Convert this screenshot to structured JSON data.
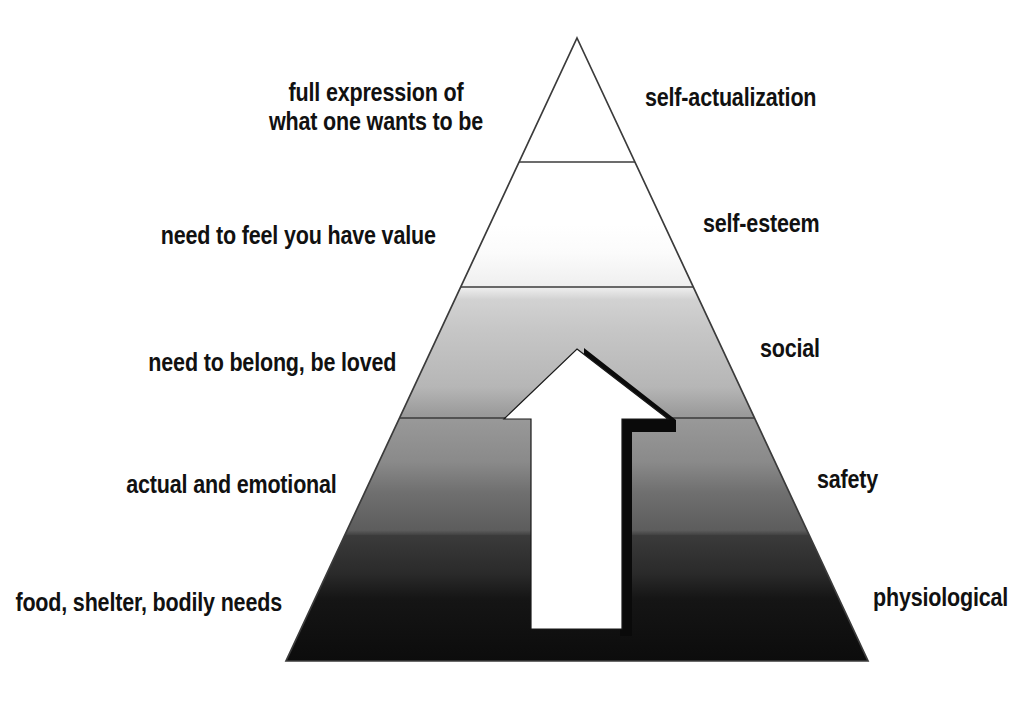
{
  "diagram": {
    "type": "maslow-hierarchy-of-needs-pyramid",
    "background_color": "#ffffff",
    "outline_color": "#333333",
    "arrow": {
      "name": "upward-progress-arrow",
      "fill_color": "#ffffff",
      "shadow_color": "#000000"
    },
    "gradient": {
      "top_color": "#ffffff",
      "bottom_color": "#0d0d0d"
    },
    "tiers": [
      {
        "id": "self-actualization",
        "name": "self-actualization",
        "description": "full expression of\nwhat one wants to be",
        "description_line_1": "full expression of",
        "description_line_2": "what one wants to be",
        "band_fill": "#ffffff"
      },
      {
        "id": "self-esteem",
        "name": "self-esteem",
        "description": "need to feel you have value",
        "band_fill": "#f2f2f2"
      },
      {
        "id": "social",
        "name": "social",
        "description": "need to belong, be loved",
        "band_fill": "#bdbdbd"
      },
      {
        "id": "safety",
        "name": "safety",
        "description": "actual and emotional",
        "band_fill": "#6e6e6e"
      },
      {
        "id": "physiological",
        "name": "physiological",
        "description": "food, shelter, bodily needs",
        "band_fill": "#141414"
      }
    ]
  }
}
